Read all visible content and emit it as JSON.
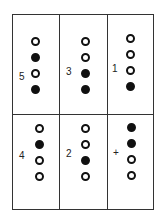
{
  "cells": [
    {
      "label": "5",
      "dots": [
        "open",
        "filled",
        "open",
        "filled"
      ]
    },
    {
      "label": "3",
      "dots": [
        "open",
        "open",
        "filled",
        "filled"
      ]
    },
    {
      "label": "1",
      "dots": [
        "open",
        "open",
        "open",
        "filled"
      ]
    },
    {
      "label": "4",
      "dots": [
        "open",
        "filled",
        "open",
        "open"
      ]
    },
    {
      "label": "2",
      "dots": [
        "open",
        "open",
        "filled",
        "open"
      ]
    },
    {
      "label": "+",
      "dots": [
        "filled",
        "filled",
        "open",
        "open"
      ]
    }
  ],
  "colors": {
    "line": "#333333",
    "dot": "#111111",
    "background": "#ffffff"
  }
}
